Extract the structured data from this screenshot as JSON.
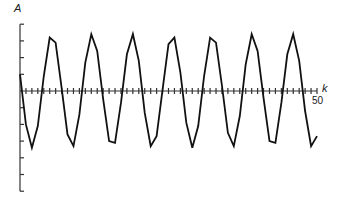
{
  "chart_data": {
    "type": "line",
    "title": "",
    "xlabel": "k",
    "ylabel": "A",
    "x_tick_labels": [
      "50"
    ],
    "xlim": [
      0,
      50
    ],
    "ylim": [
      -6,
      4
    ],
    "grid": false,
    "legend": null,
    "x": [
      0,
      1,
      2,
      3,
      4,
      5,
      6,
      7,
      8,
      9,
      10,
      11,
      12,
      13,
      14,
      15,
      16,
      17,
      18,
      19,
      20,
      21,
      22,
      23,
      24,
      25,
      26,
      27,
      28,
      29,
      30,
      31,
      32,
      33,
      34,
      35,
      36,
      37,
      38,
      39,
      40,
      41,
      42,
      43,
      44,
      45,
      46,
      47,
      48,
      49,
      50
    ],
    "series": [
      {
        "name": "A[k]",
        "values": [
          1.0,
          -2.0,
          -3.4,
          -2.1,
          0.9,
          3.2,
          2.9,
          0.2,
          -2.6,
          -3.3,
          -1.4,
          1.7,
          3.4,
          2.4,
          -0.5,
          -3.0,
          -3.1,
          -0.7,
          2.2,
          3.4,
          1.8,
          -1.3,
          -3.3,
          -2.7,
          0.1,
          2.8,
          3.2,
          1.1,
          -1.9,
          -3.4,
          -2.1,
          0.9,
          3.2,
          2.9,
          0.3,
          -2.5,
          -3.3,
          -1.5,
          1.6,
          3.4,
          2.4,
          -0.4,
          -3.0,
          -3.1,
          -0.7,
          2.2,
          3.4,
          1.8,
          -1.2,
          -3.3,
          -2.7
        ]
      }
    ]
  },
  "labels": {
    "y_axis": "A",
    "x_axis": "k",
    "x_end_tick": "50"
  }
}
